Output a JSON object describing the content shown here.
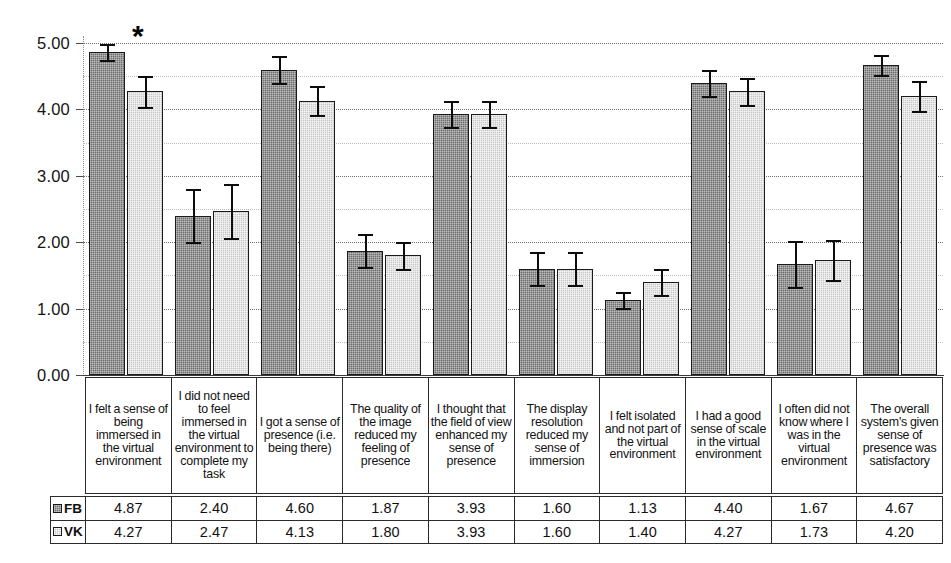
{
  "chart_data": {
    "type": "bar",
    "title": "",
    "xlabel": "",
    "ylabel": "",
    "ylim": [
      0.0,
      5.0
    ],
    "ytick_labels": [
      "0.00",
      "1.00",
      "2.00",
      "3.00",
      "4.00",
      "5.00"
    ],
    "ytick_values": [
      0,
      1,
      2,
      3,
      4,
      5
    ],
    "minor_gridlines": [
      0.5,
      1.5,
      2.5,
      3.5,
      4.5
    ],
    "grid": true,
    "legend_position": "table-left",
    "categories": [
      "I felt a sense of being immersed in the virtual environment",
      "I did not need to feel immersed in the virtual environment to complete my task",
      "I got a sense of presence (i.e. being there)",
      "The quality of the image reduced my feeling of presence",
      "I thought that the field of view enhanced my sense of presence",
      "The display resolution reduced my sense of immersion",
      "I felt isolated and not part of the virtual environment",
      "I had a good sense of scale in the virtual environment",
      "I often did not know where I was in the virtual environment",
      "The overall system's given sense of presence was satisfactory"
    ],
    "series": [
      {
        "name": "FB",
        "color": "#6e6e6e",
        "values": [
          4.87,
          2.4,
          4.6,
          1.87,
          3.93,
          1.6,
          1.13,
          4.4,
          1.67,
          4.67
        ],
        "errors": [
          0.12,
          0.4,
          0.2,
          0.25,
          0.2,
          0.25,
          0.12,
          0.2,
          0.35,
          0.15
        ]
      },
      {
        "name": "VK",
        "color": "#c6c6c6",
        "values": [
          4.27,
          2.47,
          4.13,
          1.8,
          3.93,
          1.6,
          1.4,
          4.27,
          1.73,
          4.2
        ],
        "errors": [
          0.23,
          0.4,
          0.22,
          0.2,
          0.2,
          0.25,
          0.2,
          0.2,
          0.3,
          0.23
        ]
      }
    ],
    "annotations": [
      {
        "text": "*",
        "category_index": 0,
        "note": "significance marker above first group"
      }
    ]
  },
  "data_table": {
    "rows": [
      {
        "label": "FB",
        "swatch": "fb-swatch-icon",
        "values": [
          "4.87",
          "2.40",
          "4.60",
          "1.87",
          "3.93",
          "1.60",
          "1.13",
          "4.40",
          "1.67",
          "4.67"
        ]
      },
      {
        "label": "VK",
        "swatch": "vk-swatch-icon",
        "values": [
          "4.27",
          "2.47",
          "4.13",
          "1.80",
          "3.93",
          "1.60",
          "1.40",
          "4.27",
          "1.73",
          "4.20"
        ]
      }
    ]
  }
}
